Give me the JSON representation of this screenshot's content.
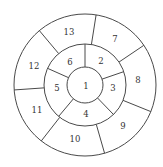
{
  "diagram": {
    "type": "concentric-segmented-circle",
    "center": [
      85,
      85
    ],
    "radii": {
      "inner": 18,
      "middle": 41,
      "outer": 71
    },
    "line_color": "#4a4a4a",
    "text_color": "#333333",
    "inner_region": {
      "label": "1",
      "pos": [
        86,
        86
      ]
    },
    "middle_ring": {
      "segments": [
        {
          "label": "2",
          "pos": [
            101,
            61
          ]
        },
        {
          "label": "3",
          "pos": [
            113,
            88
          ]
        },
        {
          "label": "4",
          "pos": [
            86,
            114
          ]
        },
        {
          "label": "5",
          "pos": [
            57,
            88
          ]
        },
        {
          "label": "6",
          "pos": [
            70,
            62
          ]
        }
      ],
      "divider_angles_deg": [
        0,
        71,
        136,
        220,
        294
      ]
    },
    "outer_ring": {
      "segments": [
        {
          "label": "7",
          "pos": [
            115,
            39
          ]
        },
        {
          "label": "8",
          "pos": [
            138,
            80
          ]
        },
        {
          "label": "9",
          "pos": [
            123,
            126
          ]
        },
        {
          "label": "10",
          "pos": [
            75,
            139
          ]
        },
        {
          "label": "11",
          "pos": [
            37,
            110
          ]
        },
        {
          "label": "12",
          "pos": [
            34,
            66
          ]
        },
        {
          "label": "13",
          "pos": [
            69,
            32
          ]
        }
      ],
      "divider_angles_deg": [
        9,
        56,
        112,
        164,
        218,
        266,
        320
      ]
    }
  }
}
